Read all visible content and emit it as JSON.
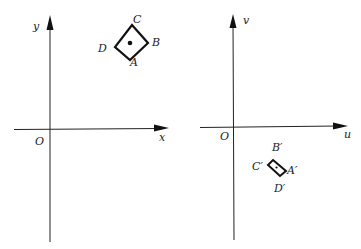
{
  "left_panel": {
    "x_axis_label": "x",
    "y_axis_label": "y",
    "origin_label": "O",
    "vertices": {
      "A": "A",
      "B": "B",
      "C": "C",
      "D": "D"
    }
  },
  "right_panel": {
    "u_axis_label": "u",
    "v_axis_label": "v",
    "origin_label": "O",
    "vertices": {
      "A": "A′",
      "B": "B′",
      "C": "C′",
      "D": "D′"
    }
  },
  "colors": {
    "ink": "#111111",
    "background": "#ffffff"
  }
}
